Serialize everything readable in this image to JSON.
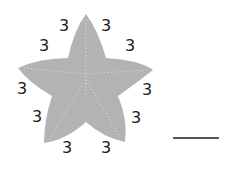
{
  "figure": {
    "shape": "five-pointed star",
    "fill_color": "#b3b3b3",
    "seam_color": "#e0e0e0",
    "side_labels": [
      {
        "text": "3",
        "x": 64,
        "y": 26
      },
      {
        "text": "3",
        "x": 106,
        "y": 26
      },
      {
        "text": "3",
        "x": 44,
        "y": 46
      },
      {
        "text": "3",
        "x": 130,
        "y": 46
      },
      {
        "text": "3",
        "x": 22,
        "y": 89
      },
      {
        "text": "3",
        "x": 147,
        "y": 90
      },
      {
        "text": "3",
        "x": 37,
        "y": 117
      },
      {
        "text": "3",
        "x": 136,
        "y": 118
      },
      {
        "text": "3",
        "x": 67,
        "y": 148
      },
      {
        "text": "3",
        "x": 106,
        "y": 148
      }
    ]
  },
  "answer": {
    "blank": "",
    "line_color": "#555555"
  }
}
